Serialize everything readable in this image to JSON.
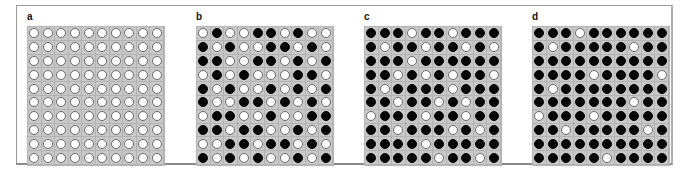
{
  "figure": {
    "panels": [
      {
        "label": "a",
        "grid": [
          "WWWWWWWWWW",
          "WWWWWWWWWW",
          "WWWWWWWWWW",
          "WWWWWWWWWW",
          "WWWWWWWWWW",
          "WWWWWWWWWW",
          "WWWWWWWWWW",
          "WWWWWWWWWW",
          "WWWWWWWWWW",
          "WWWWWWWWWW"
        ]
      },
      {
        "label": "b",
        "grid": [
          "WBWWBBWBWW",
          "BWBWWBBWBW",
          "BBWWBBWBWB",
          "WBWBWWWBBW",
          "BWBWWBWBWB",
          "BWWBBWBWBW",
          "WBBWWBWWBB",
          "BBWBBWWBWB",
          "WWBBWBBWBW",
          "BWBWBWWBWB"
        ]
      },
      {
        "label": "c",
        "grid": [
          "BBBWBBWBBB",
          "BWBBWBBWBW",
          "BBBWBBBBBB",
          "BBWBWBWBBW",
          "BWBBBBWBBB",
          "BBWBBWBWBB",
          "WBBBWBBWBB",
          "BBWBBBWBWB",
          "BBBBWBBBBB",
          "BBBBBWBBWB"
        ]
      },
      {
        "label": "d",
        "grid": [
          "BBBWBBBBBB",
          "BWBBBBBWBB",
          "BBBBBBBBBB",
          "BBBBWBBBBW",
          "BWBBBBBBBB",
          "BBBBBBBWBB",
          "WBBBWBBBBB",
          "BBWBBBBBWB",
          "BBBBBBBBBB",
          "BBBBBWBBBB"
        ]
      }
    ],
    "legend": {
      "W": "white circle (open)",
      "B": "black circle (filled)"
    },
    "colors": {
      "cell_bg": "#c8c8c8",
      "filled": "#050505",
      "open": "#ffffff",
      "frame": "#9a9a9a"
    }
  }
}
